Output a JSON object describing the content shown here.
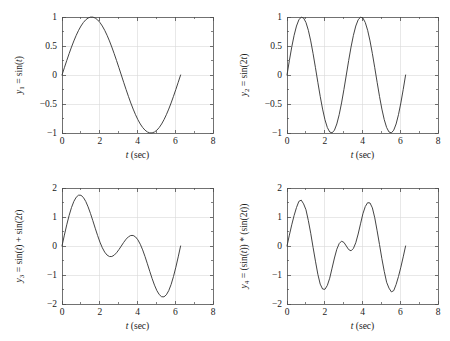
{
  "figure": {
    "background_color": "#ffffff",
    "curve_color": "#3a3a3a",
    "axis_color": "#4d4d4d",
    "grid_color": "#d8d8d8",
    "layout": "2x2 subplot grid"
  },
  "chart_data": [
    {
      "id": "plot1",
      "type": "line",
      "position": "top-left",
      "title": "",
      "xlabel_parts": {
        "symbol": "t",
        "unit": "(sec)"
      },
      "xlabel": "t (sec)",
      "ylabel_parts": {
        "var": "y",
        "sub": "1",
        "eq": " = sin(",
        "arg": "t",
        "close": ")"
      },
      "ylabel": "y1 = sin(t)",
      "expression": "sin(t)",
      "xlim": [
        0,
        8
      ],
      "ylim": [
        -1,
        1
      ],
      "xticks": [
        0,
        2,
        4,
        6,
        8
      ],
      "xticklabels": [
        "0",
        "2",
        "4",
        "6",
        "8"
      ],
      "yticks": [
        -1,
        -0.5,
        0,
        0.5,
        1
      ],
      "yticklabels": [
        "-1",
        "-0.5",
        "0",
        "0.5",
        "1"
      ],
      "x_minor_step": 1,
      "y_minor_step": 0.25,
      "grid": true,
      "legend": "none",
      "data_x_range": [
        0,
        6.2832
      ],
      "annotations": [
        "zero crossing at t=0",
        "maximum 1 at t=1.571",
        "zero crossing at t=3.142",
        "minimum -1 at t=4.712",
        "ends at t=6.283, y=0"
      ],
      "x": [
        0,
        0.1257,
        0.2513,
        0.377,
        0.5027,
        0.6283,
        0.754,
        0.8796,
        1.0053,
        1.131,
        1.2566,
        1.3823,
        1.508,
        1.6336,
        1.7593,
        1.885,
        2.0106,
        2.1363,
        2.2619,
        2.3876,
        2.5133,
        2.6389,
        2.7646,
        2.8903,
        3.0159,
        3.1416,
        3.2673,
        3.3929,
        3.5186,
        3.6442,
        3.7699,
        3.8956,
        4.0212,
        4.1469,
        4.2726,
        4.3982,
        4.5239,
        4.6496,
        4.7752,
        4.9009,
        5.0265,
        5.1522,
        5.2779,
        5.4035,
        5.5292,
        5.6549,
        5.7805,
        5.9062,
        6.0319,
        6.1575,
        6.2832
      ],
      "y": [
        0,
        0.1253,
        0.2487,
        0.3681,
        0.4818,
        0.5878,
        0.6845,
        0.7705,
        0.8443,
        0.9048,
        0.9511,
        0.9823,
        0.998,
        0.998,
        0.9823,
        0.9511,
        0.9048,
        0.8443,
        0.7705,
        0.6845,
        0.5878,
        0.4818,
        0.3681,
        0.2487,
        0.1253,
        0,
        -0.1253,
        -0.2487,
        -0.3681,
        -0.4818,
        -0.5878,
        -0.6845,
        -0.7705,
        -0.8443,
        -0.9048,
        -0.9511,
        -0.9823,
        -0.998,
        -0.998,
        -0.9823,
        -0.9511,
        -0.9048,
        -0.8443,
        -0.7705,
        -0.6845,
        -0.5878,
        -0.4818,
        -0.3681,
        -0.2487,
        -0.1253,
        0
      ]
    },
    {
      "id": "plot2",
      "type": "line",
      "position": "top-right",
      "title": "",
      "xlabel_parts": {
        "symbol": "t",
        "unit": "(sec)"
      },
      "xlabel": "t (sec)",
      "ylabel_parts": {
        "var": "y",
        "sub": "2",
        "eq": " = sin(2",
        "arg": "t",
        "close": ")"
      },
      "ylabel": "y2 = sin(2t)",
      "expression": "sin(2t)",
      "xlim": [
        0,
        8
      ],
      "ylim": [
        -1,
        1
      ],
      "xticks": [
        0,
        2,
        4,
        6,
        8
      ],
      "xticklabels": [
        "0",
        "2",
        "4",
        "6",
        "8"
      ],
      "yticks": [
        -1,
        -0.5,
        0,
        0.5,
        1
      ],
      "yticklabels": [
        "-1",
        "-0.5",
        "0",
        "0.5",
        "1"
      ],
      "x_minor_step": 1,
      "y_minor_step": 0.25,
      "grid": true,
      "legend": "none",
      "data_x_range": [
        0,
        6.2832
      ],
      "annotations": [
        "maximum 1 at t=0.785",
        "minimum -1 at t=2.356",
        "maximum 1 at t=3.927",
        "minimum -1 at t=5.498",
        "ends at t=6.283, y=0"
      ],
      "x": [
        0,
        0.1257,
        0.2513,
        0.377,
        0.5027,
        0.6283,
        0.754,
        0.8796,
        1.0053,
        1.131,
        1.2566,
        1.3823,
        1.508,
        1.6336,
        1.7593,
        1.885,
        2.0106,
        2.1363,
        2.2619,
        2.3876,
        2.5133,
        2.6389,
        2.7646,
        2.8903,
        3.0159,
        3.1416,
        3.2673,
        3.3929,
        3.5186,
        3.6442,
        3.7699,
        3.8956,
        4.0212,
        4.1469,
        4.2726,
        4.3982,
        4.5239,
        4.6496,
        4.7752,
        4.9009,
        5.0265,
        5.1522,
        5.2779,
        5.4035,
        5.5292,
        5.6549,
        5.7805,
        5.9062,
        6.0319,
        6.1575,
        6.2832
      ],
      "y": [
        0,
        0.2487,
        0.4818,
        0.6845,
        0.8443,
        0.9511,
        0.998,
        0.9823,
        0.9048,
        0.7705,
        0.5878,
        0.3681,
        0.1253,
        -0.1253,
        -0.3681,
        -0.5878,
        -0.7705,
        -0.9048,
        -0.9823,
        -0.998,
        -0.9511,
        -0.8443,
        -0.6845,
        -0.4818,
        -0.2487,
        0,
        0.2487,
        0.4818,
        0.6845,
        0.8443,
        0.9511,
        0.998,
        0.9823,
        0.9048,
        0.7705,
        0.5878,
        0.3681,
        0.1253,
        -0.1253,
        -0.3681,
        -0.5878,
        -0.7705,
        -0.9048,
        -0.9823,
        -0.998,
        -0.9511,
        -0.8443,
        -0.6845,
        -0.4818,
        -0.2487,
        0
      ]
    },
    {
      "id": "plot3",
      "type": "line",
      "position": "bottom-left",
      "title": "",
      "xlabel_parts": {
        "symbol": "t",
        "unit": "(sec)"
      },
      "xlabel": "t (sec)",
      "ylabel_parts": {
        "var": "y",
        "sub": "3",
        "eq": " = sin(",
        "arg": "t",
        "close": ") + sin(2",
        "arg2": "t",
        "close2": ")"
      },
      "ylabel": "y3 = sin(t) + sin(2t)",
      "expression": "sin(t) + sin(2t)",
      "xlim": [
        0,
        8
      ],
      "ylim": [
        -2,
        2
      ],
      "xticks": [
        0,
        2,
        4,
        6,
        8
      ],
      "xticklabels": [
        "0",
        "2",
        "4",
        "6",
        "8"
      ],
      "yticks": [
        -2,
        -1,
        0,
        1,
        2
      ],
      "yticklabels": [
        "-2",
        "-1",
        "0",
        "1",
        "2"
      ],
      "x_minor_step": 1,
      "y_minor_step": 0.5,
      "grid": true,
      "legend": "none",
      "data_x_range": [
        0,
        6.2832
      ],
      "annotations": [
        "global maximum 1.76 at t=0.96",
        "local minimum -0.37 at t=2.57",
        "local maximum 0.37 at t=3.72",
        "global minimum -1.76 at t=5.33",
        "ends at t=6.283, y=0"
      ],
      "x": [
        0,
        0.1257,
        0.2513,
        0.377,
        0.5027,
        0.6283,
        0.754,
        0.8796,
        1.0053,
        1.131,
        1.2566,
        1.3823,
        1.508,
        1.6336,
        1.7593,
        1.885,
        2.0106,
        2.1363,
        2.2619,
        2.3876,
        2.5133,
        2.6389,
        2.7646,
        2.8903,
        3.0159,
        3.1416,
        3.2673,
        3.3929,
        3.5186,
        3.6442,
        3.7699,
        3.8956,
        4.0212,
        4.1469,
        4.2726,
        4.3982,
        4.5239,
        4.6496,
        4.7752,
        4.9009,
        5.0265,
        5.1522,
        5.2779,
        5.4035,
        5.5292,
        5.6549,
        5.7805,
        5.9062,
        6.0319,
        6.1575,
        6.2832
      ],
      "y": [
        0,
        0.374,
        0.7305,
        1.0526,
        1.3261,
        1.5389,
        1.6825,
        1.7528,
        1.7491,
        1.6753,
        1.5389,
        1.3504,
        1.1233,
        0.8727,
        0.6142,
        0.3633,
        0.1343,
        -0.0605,
        -0.2118,
        -0.3135,
        -0.3633,
        -0.3625,
        -0.3164,
        -0.2331,
        -0.1234,
        0,
        0.1234,
        0.2331,
        0.3164,
        0.3625,
        0.3633,
        0.3135,
        0.2118,
        0.0605,
        -0.1343,
        -0.3633,
        -0.6142,
        -0.8727,
        -1.1233,
        -1.3504,
        -1.5389,
        -1.6753,
        -1.7491,
        -1.7528,
        -1.6825,
        -1.5389,
        -1.3261,
        -1.0526,
        -0.7305,
        -0.374,
        0
      ]
    },
    {
      "id": "plot4",
      "type": "line",
      "position": "bottom-right",
      "title": "",
      "xlabel_parts": {
        "symbol": "t",
        "unit": "(sec)"
      },
      "xlabel": "t (sec)",
      "ylabel_parts": {
        "var": "y",
        "sub": "4",
        "eq": " = (sin(",
        "arg": "t",
        "close": ")) * (sin(2",
        "arg2": "t",
        "close2": "))"
      },
      "ylabel": "y4 = (sin(t)) * (sin(2t))",
      "expression": "(sin(t)) * (sin(2t))",
      "xlim": [
        0,
        8
      ],
      "ylim": [
        -2,
        2
      ],
      "xticks": [
        0,
        2,
        4,
        6,
        8
      ],
      "xticklabels": [
        "0",
        "2",
        "4",
        "6",
        "8"
      ],
      "yticks": [
        -2,
        -1,
        0,
        1,
        2
      ],
      "yticklabels": [
        "-2",
        "-1",
        "0",
        "1",
        "2"
      ],
      "x_minor_step": 1,
      "y_minor_step": 0.5,
      "grid": true,
      "legend": "none",
      "data_x_range": [
        0,
        6.2832
      ],
      "annotations": [
        "maximum 1.55 at t=0.97",
        "minimum -1.5 at t=2.2",
        "local maximum 0 at t=3.142",
        "minimum -1.5 at t=4.08",
        "maximum 1.55 at t=5.35",
        "ends at t=6.283, y=0"
      ],
      "x": [
        0,
        0.1257,
        0.2513,
        0.377,
        0.5027,
        0.6283,
        0.754,
        0.8796,
        1.0053,
        1.131,
        1.2566,
        1.3823,
        1.508,
        1.6336,
        1.7593,
        1.885,
        2.0106,
        2.1363,
        2.2619,
        2.3876,
        2.5133,
        2.6389,
        2.7646,
        2.8903,
        3.0159,
        3.1416,
        3.2673,
        3.3929,
        3.5186,
        3.6442,
        3.7699,
        3.8956,
        4.0212,
        4.1469,
        4.2726,
        4.3982,
        4.5239,
        4.6496,
        4.7752,
        4.9009,
        5.0265,
        5.1522,
        5.2779,
        5.4035,
        5.5292,
        5.6549,
        5.7805,
        5.9062,
        6.0319,
        6.1575,
        6.2832
      ],
      "y": [
        0,
        0.374,
        0.7305,
        1.0526,
        1.3261,
        1.5389,
        1.5825,
        1.4528,
        1.2491,
        0.8753,
        0.4389,
        -0.0496,
        -0.5233,
        -0.9727,
        -1.3142,
        -1.4833,
        -1.4943,
        -1.3605,
        -1.1118,
        -0.7635,
        -0.4133,
        -0.1125,
        0.0836,
        0.1669,
        0.1234,
        0,
        -0.1234,
        -0.1669,
        -0.0836,
        0.1125,
        0.4133,
        0.7635,
        1.1118,
        1.3605,
        1.4943,
        1.4833,
        1.3142,
        0.9727,
        0.5233,
        0.0496,
        -0.4389,
        -0.8753,
        -1.2491,
        -1.4528,
        -1.5825,
        -1.5389,
        -1.3261,
        -1.0526,
        -0.7305,
        -0.374,
        0
      ]
    }
  ]
}
